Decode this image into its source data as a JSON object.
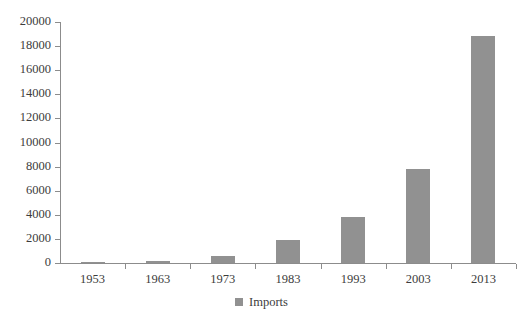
{
  "chart_data": {
    "type": "bar",
    "title": "",
    "subtitle": "",
    "xlabel": "",
    "ylabel": "",
    "categories": [
      "1953",
      "1963",
      "1973",
      "1983",
      "1993",
      "2003",
      "2013"
    ],
    "series": [
      {
        "name": "Imports",
        "color": "#919191",
        "values": [
          100,
          200,
          600,
          1900,
          3800,
          7800,
          18800
        ]
      }
    ],
    "ylim": [
      0,
      20000
    ],
    "ytick_step": 2000,
    "yticks": [
      0,
      2000,
      4000,
      6000,
      8000,
      10000,
      12000,
      14000,
      16000,
      18000,
      20000
    ],
    "ytick_labels": [
      "0",
      "2000",
      "4000",
      "6000",
      "8000",
      "10000",
      "12000",
      "14000",
      "16000",
      "18000",
      "20000"
    ],
    "grid": false,
    "legend": {
      "position": "bottom",
      "entries": [
        {
          "label": "Imports",
          "color": "#919191",
          "marker": "square-swatch"
        }
      ]
    },
    "axis_color": "#8c8c8c",
    "text_color": "#3c3c3c",
    "background": "#ffffff"
  }
}
